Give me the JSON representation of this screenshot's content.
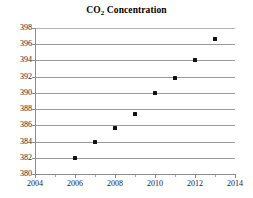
{
  "chart_data": {
    "type": "scatter",
    "title": "CO2 Concentration",
    "title_main": "CO",
    "title_sub": "2",
    "title_rest": " Concentration",
    "xlabel": "",
    "ylabel": "",
    "xlim": [
      2004,
      2014
    ],
    "ylim": [
      380,
      398
    ],
    "grid": "horizontal",
    "legend": "none",
    "x_ticks": [
      2004,
      2006,
      2008,
      2010,
      2012,
      2014
    ],
    "y_ticks": [
      380,
      382,
      384,
      386,
      388,
      390,
      392,
      394,
      396,
      398
    ],
    "x_minor_ticks": [
      2005,
      2007,
      2009,
      2011,
      2013
    ],
    "marker": "filled-square",
    "marker_color": "#111111",
    "gridline_color": "#9a9a9a",
    "axis_color": "#8c8c8c",
    "series": [
      {
        "name": "CO2 Concentration",
        "x": [
          2006,
          2007,
          2008,
          2009,
          2010,
          2011,
          2012,
          2013
        ],
        "values": [
          382.0,
          383.9,
          385.7,
          387.4,
          390.0,
          391.8,
          394.0,
          396.6
        ]
      }
    ]
  }
}
